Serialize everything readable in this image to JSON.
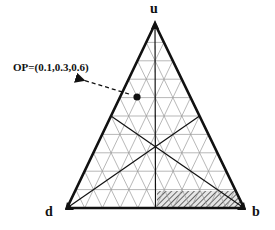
{
  "diagram": {
    "type": "ternary-plot",
    "vertices": {
      "top": "u",
      "bottom_left": "d",
      "bottom_right": "b"
    },
    "grid_divisions": 10,
    "point": {
      "label": "OP=(0.1,0.3,0.6)",
      "coords": [
        0.1,
        0.3,
        0.6
      ]
    },
    "medians": 3,
    "hatched_region": "bottom-right band near b",
    "colors": {
      "outline": "#111111",
      "grid": "#9a9a9a",
      "hatch": "#555555"
    }
  }
}
